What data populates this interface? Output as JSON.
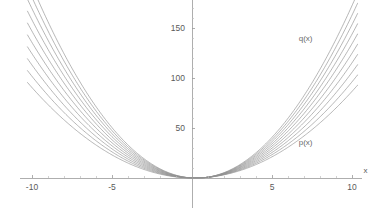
{
  "chart_data": {
    "type": "line",
    "title": "",
    "subtitle": "",
    "xlabel": "x",
    "ylabel": "",
    "xlim": [
      -10.6,
      10.6
    ],
    "ylim": [
      -30,
      178
    ],
    "grid": false,
    "legend_position": "inline-annotations",
    "x_ticks": [
      {
        "value": -10,
        "label": "-10"
      },
      {
        "value": -5,
        "label": "-5"
      },
      {
        "value": 5,
        "label": "5"
      },
      {
        "value": 10,
        "label": "10"
      }
    ],
    "y_ticks": [
      {
        "value": 50,
        "label": "50"
      },
      {
        "value": 100,
        "label": "100"
      },
      {
        "value": 150,
        "label": "150"
      }
    ],
    "x_minor_ticks": [
      -9,
      -8,
      -7,
      -6,
      -4,
      -3,
      -2,
      -1,
      1,
      2,
      3,
      4,
      6,
      7,
      8,
      9
    ],
    "y_minor_ticks": [
      10,
      20,
      30,
      40,
      60,
      70,
      80,
      90,
      110,
      120,
      130,
      140,
      160,
      170
    ],
    "annotations": [
      {
        "text": "q(x)",
        "x": 7.1,
        "y": 137
      },
      {
        "text": "p(x)",
        "x": 7.1,
        "y": 33
      },
      {
        "text": "x",
        "x": 10.85,
        "y": 5
      }
    ],
    "family_note": "family of parabolas a*x^2 + b*x interpolating from p(x) to q(x)",
    "series": [
      {
        "name": "p(x)",
        "a": 0.885,
        "b": -0.19,
        "x": [
          -10,
          -8,
          -6,
          -4,
          -2,
          0,
          2,
          4,
          6,
          8,
          10
        ],
        "values": [
          90.4,
          58.2,
          33.0,
          14.9,
          3.9,
          0.0,
          3.2,
          13.4,
          30.7,
          55.1,
          86.6
        ]
      },
      {
        "name": "curve-2",
        "a": 0.989,
        "b": -0.277,
        "x": [
          -10,
          -8,
          -6,
          -4,
          -2,
          0,
          2,
          4,
          6,
          8,
          10
        ],
        "values": [
          101.7,
          65.5,
          37.3,
          16.9,
          4.5,
          0.0,
          3.4,
          14.7,
          34.0,
          61.1,
          96.1
        ]
      },
      {
        "name": "curve-3",
        "a": 1.093,
        "b": -0.364,
        "x": [
          -10,
          -8,
          -6,
          -4,
          -2,
          0,
          2,
          4,
          6,
          8,
          10
        ],
        "values": [
          112.9,
          72.9,
          41.5,
          18.9,
          5.1,
          0.0,
          3.6,
          16.0,
          37.2,
          67.0,
          105.7
        ]
      },
      {
        "name": "curve-4",
        "a": 1.197,
        "b": -0.451,
        "x": [
          -10,
          -8,
          -6,
          -4,
          -2,
          0,
          2,
          4,
          6,
          8,
          10
        ],
        "values": [
          124.2,
          80.2,
          45.8,
          20.9,
          5.7,
          0.0,
          3.9,
          17.3,
          40.4,
          73.0,
          115.2
        ]
      },
      {
        "name": "curve-5",
        "a": 1.301,
        "b": -0.538,
        "x": [
          -10,
          -8,
          -6,
          -4,
          -2,
          0,
          2,
          4,
          6,
          8,
          10
        ],
        "values": [
          135.5,
          87.6,
          50.1,
          22.9,
          6.3,
          0.0,
          4.1,
          18.7,
          43.6,
          79.0,
          124.7
        ]
      },
      {
        "name": "curve-6",
        "a": 1.405,
        "b": -0.625,
        "x": [
          -10,
          -8,
          -6,
          -4,
          -2,
          0,
          2,
          4,
          6,
          8,
          10
        ],
        "values": [
          146.8,
          94.9,
          54.3,
          24.9,
          6.9,
          0.0,
          4.4,
          20.0,
          46.8,
          84.9,
          134.3
        ]
      },
      {
        "name": "curve-7",
        "a": 1.509,
        "b": -0.712,
        "x": [
          -10,
          -8,
          -6,
          -4,
          -2,
          0,
          2,
          4,
          6,
          8,
          10
        ],
        "values": [
          158.0,
          102.2,
          58.6,
          26.9,
          7.5,
          0.0,
          4.6,
          21.3,
          50.0,
          90.9,
          143.8
        ]
      },
      {
        "name": "q(x)",
        "a": 1.613,
        "b": -0.8,
        "x": [
          -10,
          -8,
          -6,
          -4,
          -2,
          0,
          2,
          4,
          6,
          8,
          10
        ],
        "values": [
          169.3,
          109.6,
          62.9,
          28.8,
          8.1,
          0.0,
          4.9,
          22.6,
          53.3,
          96.8,
          153.3
        ]
      },
      {
        "name": "curve-9",
        "a": 1.717,
        "b": -0.887,
        "x": [
          -10,
          -8,
          -6,
          -4,
          -2,
          0,
          2,
          4,
          6,
          8,
          10
        ],
        "values": [
          180.6,
          117.0,
          67.1,
          30.8,
          8.7,
          0.0,
          5.1,
          24.0,
          56.5,
          102.8,
          162.8
        ]
      },
      {
        "name": "curve-10",
        "a": 1.821,
        "b": -0.974,
        "x": [
          -10,
          -8,
          -6,
          -4,
          -2,
          0,
          2,
          4,
          6,
          8,
          10
        ],
        "values": [
          191.9,
          124.3,
          71.4,
          32.8,
          9.3,
          0.0,
          5.4,
          25.2,
          59.7,
          108.7,
          172.4
        ]
      }
    ]
  },
  "colors": {
    "curve": "#8f8f8f",
    "axis": "#9a9a9a",
    "tick_label": "#5a5a5a",
    "background": "#ffffff"
  }
}
